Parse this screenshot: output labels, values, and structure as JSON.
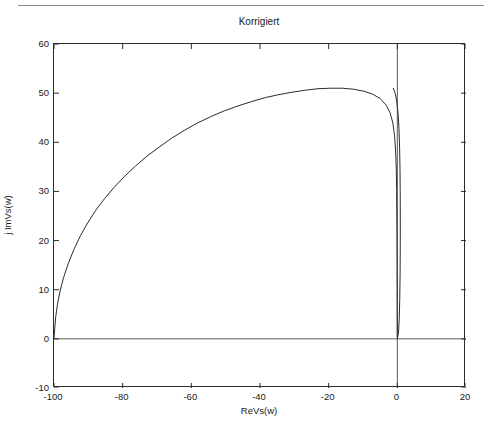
{
  "window": {
    "header_fragment": "··· ··· ····· ·· ···· ······· ··· ···· ······",
    "background": "#ffffff"
  },
  "colors": {
    "curve": "#2b2b2b",
    "axis": "#2b2b2b",
    "zero_line": "#5a5a5a",
    "text": "#1a1a1a"
  },
  "chart_data": {
    "type": "line",
    "title": "Korrigiert",
    "xlabel": "ReVs(w)",
    "ylabel": "j ImVs(w)",
    "xlim": [
      -100,
      20
    ],
    "ylim": [
      -10,
      60
    ],
    "xticks": [
      -100,
      -80,
      -60,
      -40,
      -20,
      0,
      20
    ],
    "xticklabels": [
      "-100",
      "-80",
      "-60",
      "-40",
      "-20",
      "0",
      "20"
    ],
    "yticks": [
      -10,
      0,
      10,
      20,
      30,
      40,
      50,
      60
    ],
    "yticklabels": [
      "-10",
      "0",
      "10",
      "20",
      "30",
      "40",
      "50",
      "60"
    ],
    "grid": false,
    "legend": null,
    "zero_lines": {
      "x": 0,
      "y": 0
    },
    "series": [
      {
        "name": "Vs(w)",
        "comment": "Nyquist-style depressed semicircular arc from (-100,0) rising to a peak near (-48,51) and returning into the origin (0,0) with a thin re-entrant loop.",
        "points": [
          [
            -100.0,
            0.0
          ],
          [
            -99.8,
            2.0
          ],
          [
            -99.5,
            4.5
          ],
          [
            -99.0,
            7.0
          ],
          [
            -98.2,
            9.8
          ],
          [
            -97.2,
            12.5
          ],
          [
            -95.8,
            15.4
          ],
          [
            -94.2,
            18.2
          ],
          [
            -92.3,
            21.0
          ],
          [
            -90.2,
            23.6
          ],
          [
            -87.8,
            26.2
          ],
          [
            -85.2,
            28.6
          ],
          [
            -82.4,
            30.9
          ],
          [
            -79.4,
            33.1
          ],
          [
            -76.2,
            35.2
          ],
          [
            -72.9,
            37.2
          ],
          [
            -69.4,
            39.0
          ],
          [
            -65.8,
            40.8
          ],
          [
            -62.1,
            42.4
          ],
          [
            -58.3,
            43.9
          ],
          [
            -54.4,
            45.2
          ],
          [
            -50.4,
            46.4
          ],
          [
            -46.4,
            47.4
          ],
          [
            -42.4,
            48.3
          ],
          [
            -38.4,
            49.1
          ],
          [
            -34.5,
            49.7
          ],
          [
            -30.6,
            50.2
          ],
          [
            -26.8,
            50.6
          ],
          [
            -23.1,
            50.9
          ],
          [
            -19.5,
            51.0
          ],
          [
            -16.0,
            51.0
          ],
          [
            -12.8,
            50.8
          ],
          [
            -9.8,
            50.4
          ],
          [
            -7.2,
            49.8
          ],
          [
            -5.0,
            48.9
          ],
          [
            -3.3,
            47.6
          ],
          [
            -2.1,
            46.0
          ],
          [
            -1.3,
            43.9
          ],
          [
            -0.8,
            41.3
          ],
          [
            -0.5,
            38.2
          ],
          [
            -0.3,
            34.5
          ],
          [
            -0.2,
            30.2
          ],
          [
            -0.15,
            25.4
          ],
          [
            -0.1,
            20.2
          ],
          [
            -0.08,
            15.0
          ],
          [
            -0.06,
            10.2
          ],
          [
            -0.05,
            6.2
          ],
          [
            -0.04,
            3.2
          ],
          [
            -0.03,
            1.4
          ],
          [
            -0.02,
            0.5
          ],
          [
            0.0,
            0.0
          ],
          [
            0.35,
            1.4
          ],
          [
            0.55,
            4.0
          ],
          [
            0.7,
            8.0
          ],
          [
            0.8,
            13.0
          ],
          [
            0.85,
            18.5
          ],
          [
            0.86,
            24.0
          ],
          [
            0.84,
            29.5
          ],
          [
            0.78,
            34.5
          ],
          [
            0.66,
            39.0
          ],
          [
            0.48,
            42.8
          ],
          [
            0.22,
            45.9
          ],
          [
            -0.15,
            48.2
          ],
          [
            -0.6,
            49.9
          ],
          [
            -1.2,
            51.0
          ]
        ]
      }
    ]
  }
}
